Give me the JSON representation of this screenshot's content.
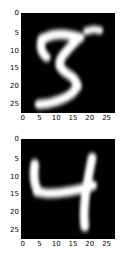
{
  "figure": {
    "background_color": "#ffffff",
    "panel_background_color": "#000000",
    "tick_color": "#000000",
    "colormap": "gray"
  },
  "chart_data": [
    {
      "type": "heatmap",
      "title": "",
      "xlabel": "",
      "ylabel": "",
      "label": "digit-5",
      "digit": "5",
      "colormap": "gray",
      "grid": false,
      "legend": "none",
      "xlim": [
        -0.5,
        27.5
      ],
      "ylim": [
        27.5,
        -0.5
      ],
      "xticks": [
        0,
        5,
        10,
        15,
        20,
        25
      ],
      "yticks": [
        0,
        5,
        10,
        15,
        20,
        25
      ],
      "xticklabels": [
        "0",
        "5",
        "10",
        "15",
        "20",
        "25"
      ],
      "yticklabels": [
        "0",
        "5",
        "10",
        "15",
        "20",
        "25"
      ],
      "shape": [
        28,
        28
      ],
      "vmin": 0,
      "vmax": 255,
      "strokes": [
        {
          "name": "top-bar",
          "points": [
            [
              6.2,
              7.4
            ],
            [
              9.0,
              6.3
            ],
            [
              12.0,
              6.0
            ],
            [
              15.0,
              6.3
            ],
            [
              17.6,
              6.9
            ]
          ],
          "width": 2.7
        },
        {
          "name": "upper-left-hook",
          "points": [
            [
              6.6,
              7.0
            ],
            [
              5.9,
              9.0
            ],
            [
              6.4,
              11.0
            ],
            [
              7.6,
              12.4
            ]
          ],
          "width": 2.5
        },
        {
          "name": "diagonal-body",
          "points": [
            [
              17.0,
              7.2
            ],
            [
              14.2,
              10.0
            ],
            [
              12.0,
              12.6
            ],
            [
              11.6,
              14.8
            ],
            [
              13.2,
              16.6
            ],
            [
              15.6,
              18.2
            ],
            [
              16.8,
              20.3
            ]
          ],
          "width": 2.6
        },
        {
          "name": "bottom-sweep",
          "points": [
            [
              16.8,
              20.6
            ],
            [
              15.0,
              22.6
            ],
            [
              12.0,
              24.2
            ],
            [
              8.6,
              25.2
            ],
            [
              5.4,
              25.6
            ]
          ],
          "width": 2.6
        },
        {
          "name": "detached-top-right-flick",
          "points": [
            [
              19.6,
              5.1
            ],
            [
              21.6,
              4.6
            ],
            [
              23.4,
              4.9
            ]
          ],
          "width": 2.1
        }
      ]
    },
    {
      "type": "heatmap",
      "title": "",
      "xlabel": "",
      "ylabel": "",
      "label": "digit-4",
      "digit": "4",
      "colormap": "gray",
      "grid": false,
      "legend": "none",
      "xlim": [
        -0.5,
        27.5
      ],
      "ylim": [
        27.5,
        -0.5
      ],
      "xticks": [
        0,
        5,
        10,
        15,
        20,
        25
      ],
      "yticks": [
        0,
        5,
        10,
        15,
        20,
        25
      ],
      "xticklabels": [
        "0",
        "5",
        "10",
        "15",
        "20",
        "25"
      ],
      "yticklabels": [
        "0",
        "5",
        "10",
        "15",
        "20",
        "25"
      ],
      "shape": [
        28,
        28
      ],
      "vmin": 0,
      "vmax": 255,
      "strokes": [
        {
          "name": "left-vertical",
          "points": [
            [
              4.1,
              7.0
            ],
            [
              3.9,
              10.0
            ],
            [
              4.2,
              12.6
            ],
            [
              5.0,
              14.6
            ]
          ],
          "width": 2.6
        },
        {
          "name": "horizontal-bar",
          "points": [
            [
              4.8,
              14.8
            ],
            [
              8.0,
              15.2
            ],
            [
              12.0,
              15.0
            ],
            [
              16.0,
              14.4
            ],
            [
              19.6,
              13.6
            ],
            [
              21.4,
              13.0
            ]
          ],
          "width": 2.6
        },
        {
          "name": "right-diagonal-descender",
          "points": [
            [
              21.2,
              5.2
            ],
            [
              20.4,
              9.0
            ],
            [
              19.6,
              13.2
            ],
            [
              19.0,
              17.6
            ],
            [
              18.8,
              21.4
            ],
            [
              19.0,
              24.6
            ]
          ],
          "width": 2.6
        }
      ]
    }
  ],
  "panels": [
    {
      "name": "panel-digit-5",
      "yticklabels": [
        "0",
        "5",
        "10",
        "15",
        "20",
        "25"
      ],
      "xticklabels": [
        "0",
        "5",
        "10",
        "15",
        "20",
        "25"
      ]
    },
    {
      "name": "panel-digit-4",
      "yticklabels": [
        "0",
        "5",
        "10",
        "15",
        "20",
        "25"
      ],
      "xticklabels": [
        "0",
        "5",
        "10",
        "15",
        "20",
        "25"
      ]
    }
  ]
}
